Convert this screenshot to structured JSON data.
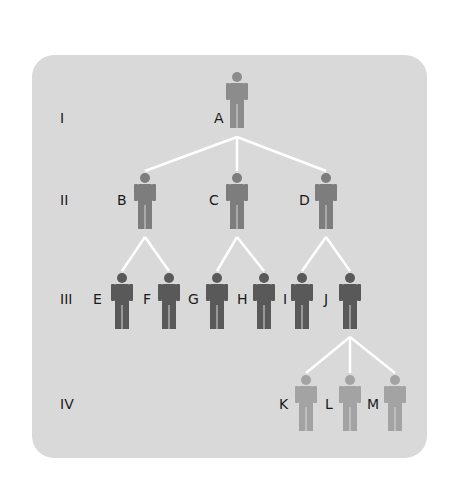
{
  "diagram": {
    "type": "pedigree",
    "panel_color": "#d9d9d9",
    "line_color": "#ffffff",
    "generations": [
      {
        "label": "I",
        "y": 118
      },
      {
        "label": "II",
        "y": 200
      },
      {
        "label": "III",
        "y": 299
      },
      {
        "label": "IV",
        "y": 404
      }
    ],
    "colors": {
      "gen1": "#8c8c8c",
      "gen2": "#808080",
      "gen3": "#595959",
      "gen4": "#aaaaaa"
    },
    "people": [
      {
        "id": "A",
        "gen": 0,
        "x": 237,
        "top": 72,
        "color": "#8c8c8c",
        "label_x": 214
      },
      {
        "id": "B",
        "gen": 1,
        "x": 145,
        "top": 173,
        "color": "#7d7d7d",
        "label_x": 117
      },
      {
        "id": "C",
        "gen": 1,
        "x": 237,
        "top": 173,
        "color": "#7d7d7d",
        "label_x": 209
      },
      {
        "id": "D",
        "gen": 1,
        "x": 326,
        "top": 173,
        "color": "#7d7d7d",
        "label_x": 299
      },
      {
        "id": "E",
        "gen": 2,
        "x": 122,
        "top": 273,
        "color": "#595959",
        "label_x": 93
      },
      {
        "id": "F",
        "gen": 2,
        "x": 169,
        "top": 273,
        "color": "#595959",
        "label_x": 143
      },
      {
        "id": "G",
        "gen": 2,
        "x": 217,
        "top": 273,
        "color": "#595959",
        "label_x": 188
      },
      {
        "id": "H",
        "gen": 2,
        "x": 264,
        "top": 273,
        "color": "#595959",
        "label_x": 237
      },
      {
        "id": "I",
        "gen": 2,
        "x": 302,
        "top": 273,
        "color": "#595959",
        "label_x": 283
      },
      {
        "id": "J",
        "gen": 2,
        "x": 350,
        "top": 273,
        "color": "#595959",
        "label_x": 324
      },
      {
        "id": "K",
        "gen": 3,
        "x": 306,
        "top": 375,
        "color": "#a3a3a3",
        "label_x": 279
      },
      {
        "id": "L",
        "gen": 3,
        "x": 350,
        "top": 375,
        "color": "#a3a3a3",
        "label_x": 325
      },
      {
        "id": "M",
        "gen": 3,
        "x": 395,
        "top": 375,
        "color": "#a3a3a3",
        "label_x": 367
      }
    ],
    "links": [
      {
        "from": "A",
        "to": [
          "B",
          "C",
          "D"
        ],
        "junction": [
          237,
          137
        ]
      },
      {
        "from": "B",
        "to": [
          "E",
          "F"
        ],
        "junction": [
          145,
          237
        ]
      },
      {
        "from": "C",
        "to": [
          "G",
          "H"
        ],
        "junction": [
          237,
          237
        ]
      },
      {
        "from": "D",
        "to": [
          "I",
          "J"
        ],
        "junction": [
          326,
          237
        ]
      },
      {
        "from": "J",
        "to": [
          "K",
          "L",
          "M"
        ],
        "junction": [
          350,
          337
        ]
      }
    ]
  }
}
